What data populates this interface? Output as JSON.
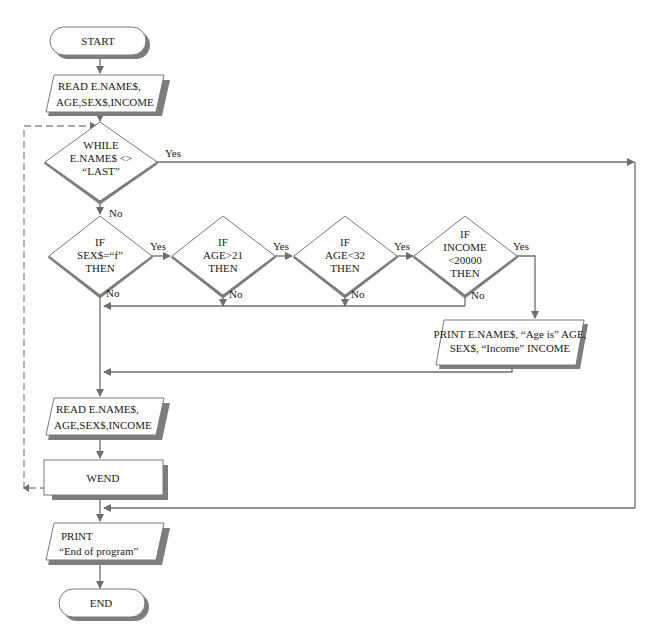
{
  "diagram": {
    "type": "flowchart",
    "nodes": {
      "start": {
        "label": "START"
      },
      "read1": {
        "line1": "READ E.NAME$,",
        "line2": "AGE,SEX$,INCOME"
      },
      "while": {
        "line1": "WHILE",
        "line2": "E.NAME$ <>",
        "line3": "“LAST”"
      },
      "if_sex": {
        "line1": "IF",
        "line2": "SEX$=“f”",
        "line3": "THEN"
      },
      "if_age21": {
        "line1": "IF",
        "line2": "AGE>21",
        "line3": "THEN"
      },
      "if_age32": {
        "line1": "IF",
        "line2": "AGE<32",
        "line3": "THEN"
      },
      "if_income": {
        "line1": "IF",
        "line2": "INCOME",
        "line3": "<20000",
        "line4": "THEN"
      },
      "print_record": {
        "line1": "PRINT E.NAME$, “Age is” AGE,",
        "line2": "SEX$, “Income” INCOME"
      },
      "read2": {
        "line1": "READ E.NAME$,",
        "line2": "AGE,SEX$,INCOME"
      },
      "wend": {
        "label": "WEND"
      },
      "print_end": {
        "line1": "PRINT",
        "line2": "“End of program”"
      },
      "end": {
        "label": "END"
      }
    },
    "edge_labels": {
      "while_yes": "Yes",
      "while_no": "No",
      "sex_yes": "Yes",
      "sex_no": "No",
      "age21_yes": "Yes",
      "age21_no": "No",
      "age32_yes": "Yes",
      "age32_no": "No",
      "income_yes": "Yes",
      "income_no": "No"
    },
    "edges": [
      {
        "from": "start",
        "to": "read1"
      },
      {
        "from": "read1",
        "to": "while"
      },
      {
        "from": "while",
        "to": "if_sex",
        "label": "No"
      },
      {
        "from": "while",
        "to": "print_end",
        "label": "Yes"
      },
      {
        "from": "if_sex",
        "to": "if_age21",
        "label": "Yes"
      },
      {
        "from": "if_age21",
        "to": "if_age32",
        "label": "Yes"
      },
      {
        "from": "if_age32",
        "to": "if_income",
        "label": "Yes"
      },
      {
        "from": "if_income",
        "to": "print_record",
        "label": "Yes"
      },
      {
        "from": "if_sex",
        "to": "read2",
        "label": "No"
      },
      {
        "from": "if_age21",
        "to": "read2",
        "label": "No"
      },
      {
        "from": "if_age32",
        "to": "read2",
        "label": "No"
      },
      {
        "from": "if_income",
        "to": "read2",
        "label": "No"
      },
      {
        "from": "print_record",
        "to": "read2"
      },
      {
        "from": "read2",
        "to": "wend"
      },
      {
        "from": "wend",
        "to": "while",
        "style": "dashed"
      },
      {
        "from": "print_end",
        "to": "end"
      }
    ],
    "colors": {
      "line": "#6e6e6e",
      "shadow": "#7d7d7d",
      "fill": "#ffffff"
    }
  }
}
